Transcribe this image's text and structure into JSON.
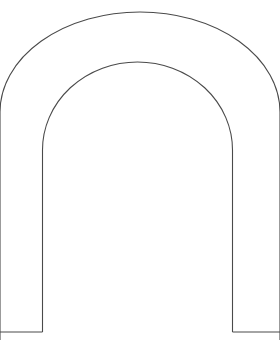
{
  "document": {
    "title": "Arch Outline Template",
    "kind": "line-drawing",
    "background_color": "#ffffff",
    "width": 280,
    "height": 340
  },
  "figure": {
    "name": "horseshoe-arch-outline",
    "stroke_color": "#4a4a4a",
    "stroke_width": 1.1,
    "fill": "none",
    "outer_arc": {
      "name": "outer-arch-arc",
      "apex": [
        140,
        12
      ],
      "center": [
        140,
        112
      ],
      "radius": 140,
      "left_edge_exit": [
        0,
        112
      ],
      "right_edge_exit": [
        280,
        112
      ]
    },
    "inner_arc": {
      "name": "inner-arch-arc",
      "apex": [
        140,
        62
      ],
      "center": [
        137.5,
        150
      ],
      "radius_x": 95,
      "radius_y": 88,
      "left_leg_x": 42.5,
      "right_leg_x": 232.5,
      "leg_start_y": 150
    },
    "inner_legs": {
      "name": "inner-arch-legs",
      "left_x": 42.5,
      "right_x": 232.5,
      "top_y": 150,
      "bottom_y": 332
    },
    "bottom_edges": {
      "name": "arch-base-lines",
      "y": 332,
      "left_segment": [
        0,
        42.5
      ],
      "right_segment": [
        232.5,
        280
      ]
    },
    "paths": {
      "outer": "M 0 340 L 0 112 A 140 100 0 0 1 280 112 L 280 340",
      "inner": "M 42.5 332 L 42.5 150 A 95 88 0 0 1 232.5 150 L 232.5 332",
      "base_left": "M 0 332 L 42.5 332",
      "base_right": "M 232.5 332 L 280 332"
    }
  }
}
